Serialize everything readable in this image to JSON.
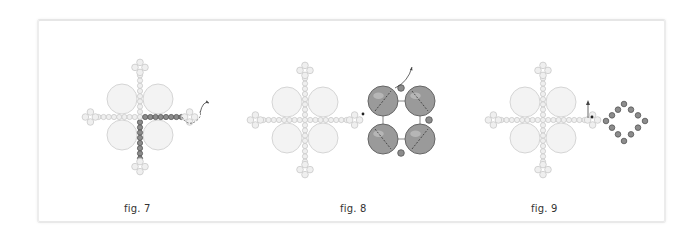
{
  "figures": [
    {
      "id": "fig7",
      "caption": "fig. 7"
    },
    {
      "id": "fig8",
      "caption": "fig. 8"
    },
    {
      "id": "fig9",
      "caption": "fig. 9"
    }
  ],
  "colors": {
    "pale_bead_fill": "#efefef",
    "pale_bead_stroke": "#c9c9c9",
    "dark_bead_fill": "#8c8c8c",
    "dark_bead_stroke": "#555555",
    "large_pearl_fill": "#f3f3f3",
    "large_pearl_stroke": "#d5d5d5",
    "dark_pearl_fill": "#9a9a9a",
    "thread": "#444444"
  }
}
